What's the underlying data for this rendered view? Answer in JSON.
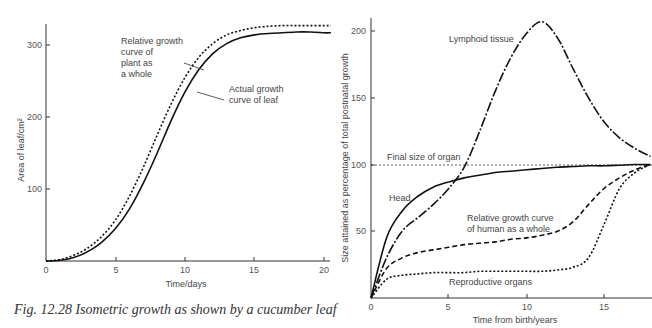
{
  "chart_data": [
    {
      "type": "line",
      "title": "",
      "caption": "Fig. 12.28 Isometric growth as shown by a cucumber leaf",
      "xlabel": "Time/days",
      "ylabel": "Area of leaf/cm²",
      "xlim": [
        0,
        20.5
      ],
      "ylim": [
        0,
        330
      ],
      "xticks": [
        0,
        5,
        10,
        15,
        20
      ],
      "yticks": [
        100,
        200,
        300
      ],
      "grid": false,
      "legend": "annotations",
      "x": [
        0,
        1,
        2,
        3,
        4,
        5,
        6,
        7,
        8,
        9,
        10,
        11,
        12,
        13,
        14,
        15,
        16,
        17,
        18,
        19,
        20,
        20.5
      ],
      "series": [
        {
          "name": "Relative growth curve of plant as a whole",
          "style": "dotted",
          "values": [
            0,
            2,
            8,
            18,
            34,
            57,
            90,
            130,
            175,
            218,
            255,
            283,
            302,
            314,
            320,
            324,
            326,
            327,
            327,
            327,
            327,
            327
          ]
        },
        {
          "name": "Actual growth curve of leaf",
          "style": "solid",
          "values": [
            0,
            1,
            5,
            13,
            26,
            45,
            72,
            108,
            150,
            195,
            235,
            266,
            288,
            302,
            310,
            314,
            316,
            317,
            318,
            318,
            317,
            317
          ]
        }
      ],
      "annotations": [
        {
          "text": [
            "Relative growth",
            "curve of",
            "plant as",
            "a whole"
          ]
        },
        {
          "text": [
            "Actual growth",
            "curve of leaf"
          ]
        }
      ]
    },
    {
      "type": "line",
      "title": "",
      "xlabel": "Time from birth/years",
      "ylabel": "Size attained as percentage of total postnatal growth",
      "xlim": [
        0,
        18
      ],
      "ylim": [
        0,
        210
      ],
      "xticks": [
        0,
        5,
        10,
        15
      ],
      "yticks": [
        50,
        100,
        150,
        200
      ],
      "grid": false,
      "reference_line": {
        "label": "Final size of organ",
        "y": 100,
        "style": "dotted"
      },
      "x": [
        0,
        1,
        2,
        3,
        4,
        5,
        6,
        7,
        8,
        9,
        10,
        11,
        12,
        13,
        14,
        15,
        16,
        17,
        18
      ],
      "series": [
        {
          "name": "Lymphoid tissue",
          "style": "dash-dot",
          "values": [
            0,
            30,
            50,
            60,
            70,
            82,
            98,
            125,
            155,
            180,
            198,
            207,
            195,
            172,
            150,
            132,
            120,
            112,
            106
          ]
        },
        {
          "name": "Head",
          "style": "solid",
          "values": [
            0,
            45,
            65,
            76,
            83,
            87,
            90,
            92,
            94,
            95,
            96,
            97,
            98,
            98.5,
            99,
            99,
            99.5,
            100,
            100
          ]
        },
        {
          "name": "Relative growth curve of human as a whole",
          "style": "dashed",
          "values": [
            0,
            22,
            30,
            34,
            36,
            38,
            40,
            41,
            42,
            44,
            45,
            47,
            50,
            57,
            70,
            82,
            90,
            96,
            100
          ]
        },
        {
          "name": "Reproductive organs",
          "style": "dotted",
          "values": [
            0,
            14,
            17,
            18,
            19,
            19,
            19,
            20,
            20,
            20,
            20,
            20,
            21,
            23,
            30,
            55,
            82,
            94,
            100
          ]
        }
      ],
      "annotations": [
        {
          "text": "Lymphoid tissue"
        },
        {
          "text": "Final size of organ"
        },
        {
          "text": "Head"
        },
        {
          "text": [
            "Relative growth curve",
            "of human as a whole"
          ]
        },
        {
          "text": "Reproductive organs"
        }
      ]
    }
  ],
  "left_chart": {
    "ylabel": "Area of leaf/cm²",
    "xlabel": "Time/days",
    "ytick_labels": [
      "300",
      "200",
      "100"
    ],
    "xtick_labels": [
      "0",
      "5",
      "10",
      "15",
      "20"
    ],
    "annot_relative": [
      "Relative growth",
      "curve of",
      "plant as",
      "a whole"
    ],
    "annot_actual": [
      "Actual growth",
      "curve of leaf"
    ],
    "caption": "Fig. 12.28 Isometric growth as shown by a cucumber leaf"
  },
  "right_chart": {
    "ylabel": "Size attained as percentage of total postnatal growth",
    "xlabel": "Time from birth/years",
    "ytick_labels": [
      "200",
      "150",
      "100",
      "50"
    ],
    "xtick_labels": [
      "0",
      "5",
      "10",
      "15"
    ],
    "annot_lymphoid": "Lymphoid tissue",
    "annot_final": "Final size of organ",
    "annot_head": "Head",
    "annot_relative": [
      "Relative growth curve",
      "of human as a whole"
    ],
    "annot_reproductive": "Reproductive organs"
  },
  "colors": {
    "axis": "#333333",
    "line": "#111111",
    "text": "#444444"
  }
}
